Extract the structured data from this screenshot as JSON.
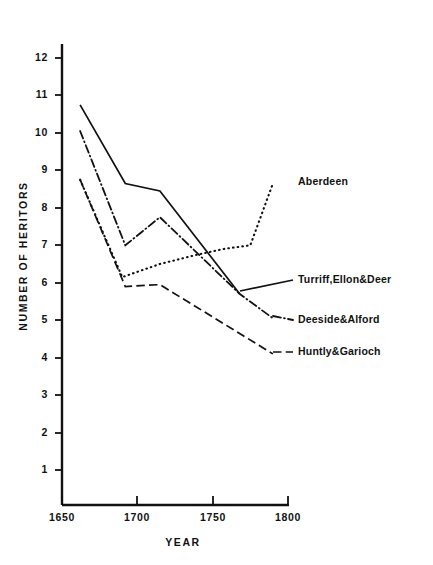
{
  "chart_data": {
    "type": "line",
    "title": "",
    "subtitle": "",
    "xlabel": "YEAR",
    "ylabel": "NUMBER OF HERITORS",
    "xlim": [
      1650,
      1800
    ],
    "ylim": [
      0,
      12.6
    ],
    "xticks": [
      1650,
      1700,
      1750,
      1800
    ],
    "xtick_labels": [
      "1650",
      "1700",
      "1750",
      "1800"
    ],
    "yticks": [
      1,
      2,
      3,
      4,
      5,
      6,
      7,
      8,
      9,
      10,
      11,
      12
    ],
    "ytick_labels": [
      "1",
      "2",
      "3",
      "4",
      "5",
      "6",
      "7",
      "8",
      "9",
      "10",
      "11",
      "12"
    ],
    "grid": false,
    "legend_position": "right-inline-labels",
    "series": [
      {
        "name": "Aberdeen",
        "linestyle": "dotted",
        "color": "#111111",
        "x": [
          1662,
          1690,
          1715,
          1740,
          1757,
          1775,
          1790
        ],
        "values": [
          8.75,
          6.15,
          6.5,
          6.75,
          6.9,
          7.0,
          8.65
        ]
      },
      {
        "name": "Turriff,Ellon&Deer",
        "linestyle": "solid",
        "color": "#111111",
        "x": [
          1662,
          1692,
          1715,
          1768
        ],
        "values": [
          10.75,
          8.65,
          8.45,
          5.7
        ]
      },
      {
        "name": "Deeside&Alford",
        "linestyle": "dashdot",
        "color": "#111111",
        "x": [
          1662,
          1692,
          1715,
          1768,
          1790
        ],
        "values": [
          10.05,
          7.0,
          7.75,
          5.7,
          5.05
        ]
      },
      {
        "name": "Huntly&Garioch",
        "linestyle": "dashed",
        "color": "#111111",
        "x": [
          1662,
          1692,
          1715,
          1790
        ],
        "values": [
          8.75,
          5.9,
          5.95,
          4.1
        ]
      }
    ],
    "annotations": [
      {
        "text": "Aberdeen",
        "target_x": 1800,
        "target_y": 8.65
      },
      {
        "text": "Turriff,Ellon&Deer",
        "target_x": 1768,
        "target_y": 5.7
      },
      {
        "text": "Deeside&Alford",
        "target_x": 1790,
        "target_y": 5.05
      },
      {
        "text": "Huntly&Garioch",
        "target_x": 1790,
        "target_y": 4.1
      }
    ]
  },
  "axes": {
    "x": {
      "label": "YEAR",
      "ticks": [
        "1650",
        "1700",
        "1750",
        "1800"
      ]
    },
    "y": {
      "label": "NUMBER OF HERITORS",
      "ticks": [
        "12",
        "11",
        "10",
        "9",
        "8",
        "7",
        "6",
        "5",
        "4",
        "3",
        "2",
        "1"
      ]
    }
  },
  "colors": {
    "ink": "#111111",
    "background": "#ffffff"
  }
}
